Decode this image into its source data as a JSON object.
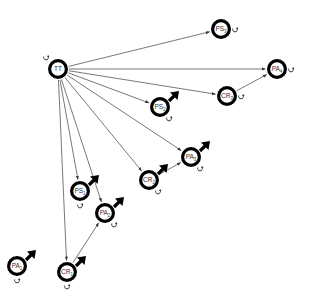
{
  "diagram": {
    "type": "directed-graph",
    "colors": {
      "node_stroke": "#000000",
      "node_fill": "#ffffff",
      "edge": "#555555",
      "label": "#333333"
    },
    "nodes": [
      {
        "id": "TT",
        "label": "TT",
        "base": "TT",
        "sub": "",
        "x": 58,
        "y": 69,
        "self_loop": true,
        "loop_side": "top-left",
        "activation_arrow": false
      },
      {
        "id": "PS3",
        "label": "PS3",
        "base": "PS",
        "sub": "3",
        "x": 221,
        "y": 29,
        "self_loop": true,
        "loop_side": "right",
        "activation_arrow": false
      },
      {
        "id": "PA4",
        "label": "PA4",
        "base": "PA",
        "sub": "4",
        "x": 277,
        "y": 69,
        "self_loop": true,
        "loop_side": "right",
        "activation_arrow": false
      },
      {
        "id": "CR3",
        "label": "CR3",
        "base": "CR",
        "sub": "3",
        "x": 227,
        "y": 96,
        "self_loop": true,
        "loop_side": "right",
        "activation_arrow": false
      },
      {
        "id": "PS2",
        "label": "PS2",
        "base": "PS",
        "sub": "2",
        "x": 160,
        "y": 107,
        "self_loop": true,
        "loop_side": "bottom-right",
        "activation_arrow": true
      },
      {
        "id": "PA3",
        "label": "PA3",
        "base": "PA",
        "sub": "3",
        "x": 191,
        "y": 157,
        "self_loop": true,
        "loop_side": "bottom-right",
        "activation_arrow": true
      },
      {
        "id": "CR2",
        "label": "CR2",
        "base": "CR",
        "sub": "2",
        "x": 149,
        "y": 180,
        "self_loop": true,
        "loop_side": "bottom-right",
        "activation_arrow": true
      },
      {
        "id": "PS1",
        "label": "PS1",
        "base": "PS",
        "sub": "1",
        "x": 80,
        "y": 191,
        "self_loop": true,
        "loop_side": "bottom",
        "activation_arrow": true
      },
      {
        "id": "PA2",
        "label": "PA2",
        "base": "PA",
        "sub": "2",
        "x": 105,
        "y": 213,
        "self_loop": true,
        "loop_side": "bottom-right",
        "activation_arrow": true
      },
      {
        "id": "PA1",
        "label": "PA1",
        "base": "PA",
        "sub": "1",
        "x": 17,
        "y": 266,
        "self_loop": true,
        "loop_side": "bottom",
        "activation_arrow": true
      },
      {
        "id": "CR1",
        "label": "CR1",
        "base": "CR",
        "sub": "1",
        "x": 67,
        "y": 272,
        "self_loop": true,
        "loop_side": "bottom",
        "activation_arrow": true
      }
    ],
    "edges": [
      {
        "from": "TT",
        "to": "PS3"
      },
      {
        "from": "TT",
        "to": "PA4"
      },
      {
        "from": "TT",
        "to": "CR3"
      },
      {
        "from": "TT",
        "to": "PS2"
      },
      {
        "from": "TT",
        "to": "PA3"
      },
      {
        "from": "TT",
        "to": "CR2"
      },
      {
        "from": "TT",
        "to": "PA2"
      },
      {
        "from": "TT",
        "to": "PS1"
      },
      {
        "from": "TT",
        "to": "CR1"
      },
      {
        "from": "CR3",
        "to": "PA4"
      },
      {
        "from": "CR2",
        "to": "PA3"
      },
      {
        "from": "CR1",
        "to": "PA2"
      }
    ]
  }
}
